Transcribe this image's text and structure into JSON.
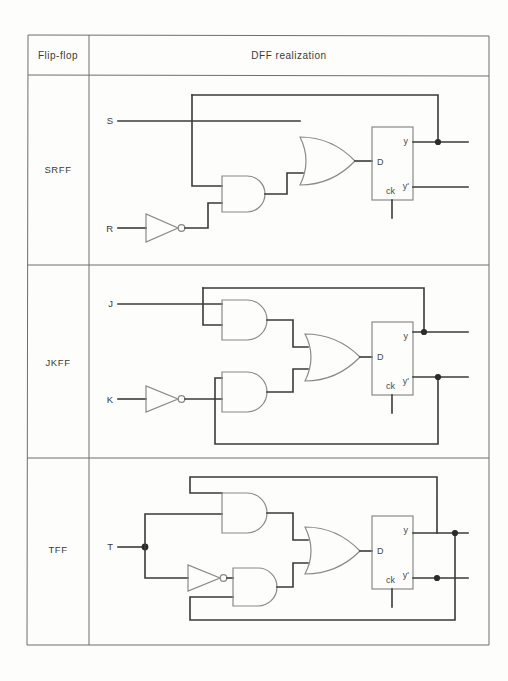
{
  "table": {
    "header": {
      "col1": "Flip-flop",
      "col2": "DFF realization"
    },
    "rows": [
      {
        "name": "SRFF",
        "inputs": [
          "S",
          "R"
        ],
        "inverted_inputs": [
          "R"
        ],
        "gates": {
          "and": 1,
          "or": 1,
          "not": 1
        },
        "dff": {
          "d": "D",
          "ck": "ck",
          "q": "y",
          "qbar": "y'"
        },
        "feedback": [
          "y"
        ]
      },
      {
        "name": "JKFF",
        "inputs": [
          "J",
          "K"
        ],
        "inverted_inputs": [
          "K"
        ],
        "gates": {
          "and": 2,
          "or": 1,
          "not": 1
        },
        "dff": {
          "d": "D",
          "ck": "ck",
          "q": "y",
          "qbar": "y'"
        },
        "feedback": [
          "y",
          "y'"
        ]
      },
      {
        "name": "TFF",
        "inputs": [
          "T"
        ],
        "inverted_inputs": [
          "T"
        ],
        "gates": {
          "and": 2,
          "or": 1,
          "not": 1
        },
        "dff": {
          "d": "D",
          "ck": "ck",
          "q": "y",
          "qbar": "y'"
        },
        "feedback": [
          "y",
          "y'"
        ]
      }
    ]
  },
  "colors": {
    "wire": "#3a3a3a",
    "gate_outline": "#8a8a8a",
    "table_border": "#6e6e6e",
    "paper": "#fdfdfb"
  }
}
